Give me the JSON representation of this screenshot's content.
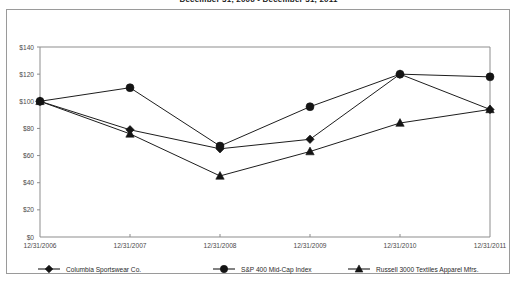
{
  "chart_title": "December 31, 2006 - December 31, 2011",
  "axes": {
    "y_ticks": [
      "$0",
      "$20",
      "$40",
      "$60",
      "$80",
      "$100",
      "$120",
      "$140"
    ],
    "x_ticks": [
      "12/31/2006",
      "12/31/2007",
      "12/31/2008",
      "12/31/2009",
      "12/31/2010",
      "12/31/2011"
    ]
  },
  "legend": [
    {
      "label": "Columbia Sportswear Co.",
      "marker": "diamond-marker"
    },
    {
      "label": "S&P 400 Mid-Cap Index",
      "marker": "circle-marker"
    },
    {
      "label": "Russell 3000 Textiles Apparel Mfrs.",
      "marker": "triangle-marker"
    }
  ],
  "colors": {
    "line": "#1d1d1d",
    "axis": "#8d8d8d",
    "frame": "#9a9a9a",
    "text": "#2a2a2a"
  },
  "chart_data": {
    "type": "line",
    "title": "December 31, 2006 - December 31, 2011",
    "xlabel": "",
    "ylabel": "",
    "ylim": [
      0,
      140
    ],
    "ytick_values": [
      0,
      20,
      40,
      60,
      80,
      100,
      120,
      140
    ],
    "grid": false,
    "legend_position": "bottom",
    "categories": [
      "12/31/2006",
      "12/31/2007",
      "12/31/2008",
      "12/31/2009",
      "12/31/2010",
      "12/31/2011"
    ],
    "series": [
      {
        "name": "Columbia Sportswear Co.",
        "marker": "diamond",
        "values": [
          100,
          79,
          65,
          72,
          120,
          94
        ]
      },
      {
        "name": "S&P 400 Mid-Cap Index",
        "marker": "circle",
        "values": [
          100,
          110,
          67,
          96,
          120,
          118
        ]
      },
      {
        "name": "Russell 3000 Textiles Apparel Mfrs.",
        "marker": "triangle",
        "values": [
          100,
          76,
          45,
          63,
          84,
          94
        ]
      }
    ]
  }
}
